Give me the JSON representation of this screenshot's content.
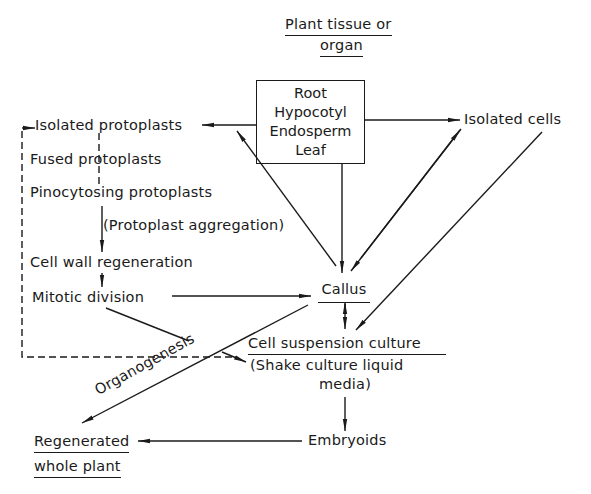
{
  "title": {
    "line1": "Plant tissue or",
    "line2": "organ"
  },
  "source_box": {
    "items": [
      "Root",
      "Hypocotyl",
      "Endosperm",
      "Leaf"
    ]
  },
  "nodes": {
    "isolated_protoplasts": "Isolated protoplasts",
    "fused_protoplasts": "Fused protoplasts",
    "pinocytosing_protoplasts": "Pinocytosing protoplasts",
    "protoplast_aggregation": "(Protoplast aggregation)",
    "cell_wall_regeneration": "Cell wall regeneration",
    "mitotic_division": "Mitotic division",
    "isolated_cells": "Isolated cells",
    "callus": "Callus",
    "cell_suspension_culture": "Cell suspension culture",
    "shake_culture_line1": "(Shake culture liquid",
    "shake_culture_line2": "media)",
    "embryoids": "Embryoids",
    "regenerated_line1": "Regenerated",
    "regenerated_line2": "whole plant"
  },
  "edge_labels": {
    "organogenesis": "Organogenesis"
  }
}
